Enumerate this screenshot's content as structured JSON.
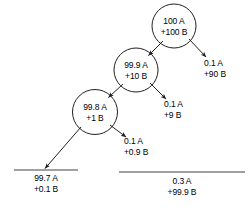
{
  "diagram": {
    "type": "cascade-separation-tree",
    "background_color": "#ffffff",
    "stroke_color": "#231f20",
    "text_color": "#000000",
    "nodes": [
      {
        "id": "stage-1",
        "line1": "100 A",
        "line2": "+100 B",
        "cx": 174,
        "cy": 26,
        "r": 22
      },
      {
        "id": "stage-2",
        "line1": "99.9 A",
        "line2": "+10 B",
        "cx": 136,
        "cy": 70,
        "r": 22
      },
      {
        "id": "stage-3",
        "line1": "99.8 A",
        "line2": "+1 B",
        "cx": 95,
        "cy": 112,
        "r": 22.5
      }
    ],
    "branches": [
      {
        "id": "waste-1",
        "line1": "0.1 A",
        "line2": "+90 B",
        "x": 204,
        "y": 58
      },
      {
        "id": "waste-2",
        "line1": "0.1 A",
        "line2": "+9 B",
        "x": 164,
        "y": 99
      },
      {
        "id": "waste-3",
        "line1": "0.1 A",
        "line2": "+0.9 B",
        "x": 124,
        "y": 136
      }
    ],
    "results": [
      {
        "id": "product-stream",
        "line1": "99.7 A",
        "line2": "+0.1 B",
        "cx": 46,
        "y": 173,
        "rule_x1": 14,
        "rule_x2": 78,
        "rule_y": 170
      },
      {
        "id": "waste-stream",
        "line1": "0.3 A",
        "line2": "+99.9 B",
        "cx": 182,
        "y": 176,
        "rule_x1": 119,
        "rule_x2": 245,
        "rule_y": 172
      }
    ]
  }
}
